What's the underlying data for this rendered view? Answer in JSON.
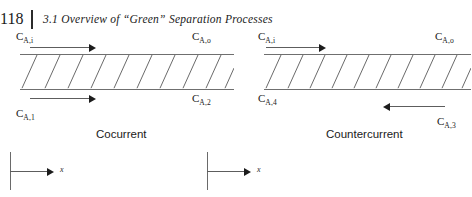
{
  "header": {
    "folio": "118",
    "section_number": "3.1",
    "title": "3.1  Overview of “Green” Separation Processes"
  },
  "figure": {
    "panels": [
      {
        "id": "cocurrent",
        "caption": "Cocurrent",
        "axis_label": "x",
        "hatch_count": 10,
        "labels": {
          "top_left": {
            "base": "C",
            "sub": "A,i"
          },
          "top_right": {
            "base": "C",
            "sub": "A,o"
          },
          "bottom_left": {
            "base": "C",
            "sub": "A,1"
          },
          "bottom_right": {
            "base": "C",
            "sub": "A,2"
          }
        },
        "arrows": [
          {
            "name": "top-flow-arrow",
            "direction": "right"
          },
          {
            "name": "bottom-flow-arrow",
            "direction": "right"
          }
        ]
      },
      {
        "id": "countercurrent",
        "caption": "Countercurrent",
        "axis_label": "x",
        "hatch_count": 10,
        "labels": {
          "top_left": {
            "base": "C",
            "sub": "A,i"
          },
          "top_right": {
            "base": "C",
            "sub": "A,o"
          },
          "bottom_left": {
            "base": "C",
            "sub": "A,4"
          },
          "bottom_right": {
            "base": "C",
            "sub": "A,3"
          }
        },
        "arrows": [
          {
            "name": "top-flow-arrow",
            "direction": "right"
          },
          {
            "name": "bottom-flow-arrow",
            "direction": "left"
          }
        ]
      }
    ]
  },
  "colors": {
    "ink": "#1a1a1a",
    "wall": "#6f6f6f",
    "hatch": "#5a5a5a",
    "arrow": "#1c1c1c",
    "page": "#ffffff"
  }
}
